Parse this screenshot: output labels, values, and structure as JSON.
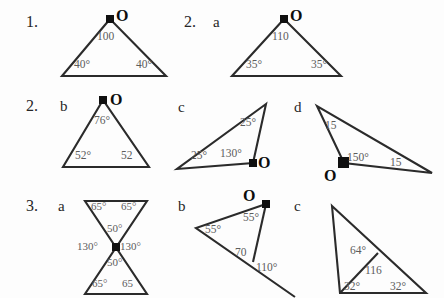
{
  "worksheet": {
    "background_color": "#fdfdfd",
    "line_color": "#2b2b2b",
    "label_color": "#5c5c5c",
    "rows": [
      {
        "number_label": "1.",
        "items": [
          {
            "part_label": "",
            "vertex_label": "O",
            "angles": [
              "100",
              "40°",
              "40°"
            ]
          },
          {
            "part_label": "a",
            "vertex_label": "O",
            "angles": [
              "110",
              "35°",
              "35°"
            ]
          }
        ]
      },
      {
        "number_label": "2.",
        "items": [
          {
            "part_label": "b",
            "vertex_label": "O",
            "angles": [
              "76°",
              "52°",
              "52"
            ]
          },
          {
            "part_label": "c",
            "vertex_label": "O",
            "angles": [
              "25°",
              "25°",
              "130°"
            ]
          },
          {
            "part_label": "d",
            "vertex_label": "O",
            "angles": [
              "15",
              "150°",
              "15"
            ]
          }
        ]
      },
      {
        "number_label": "3.",
        "items": [
          {
            "part_label": "a",
            "vertex_label": "",
            "angles": [
              "65°",
              "65°",
              "50°",
              "130°",
              "130°",
              "50°",
              "65°",
              "65"
            ]
          },
          {
            "part_label": "b",
            "vertex_label": "O",
            "angles": [
              "55°",
              "55°",
              "70",
              "110°"
            ]
          },
          {
            "part_label": "c",
            "vertex_label": "",
            "angles": [
              "64°",
              "116",
              "32°",
              "32°"
            ]
          }
        ]
      }
    ]
  },
  "row1": {
    "number": "1.",
    "fig1": {
      "o": "O",
      "apex_angle": "100",
      "left_angle": "40°",
      "right_angle": "40°"
    },
    "num2": "2.",
    "part_a": "a",
    "fig2a": {
      "o": "O",
      "apex_angle": "110",
      "left_angle": "35°",
      "right_angle": "35°"
    }
  },
  "row2": {
    "number": "2.",
    "part_b": "b",
    "fig2b": {
      "o": "O",
      "apex_angle": "76°",
      "left_angle": "52°",
      "right_angle": "52"
    },
    "part_c": "c",
    "fig2c": {
      "o": "O",
      "top_angle": "25°",
      "left_angle": "25°",
      "o_angle": "130°"
    },
    "part_d": "d",
    "fig2d": {
      "o": "O",
      "top_angle": "15",
      "o_angle": "150°",
      "right_angle": "15"
    }
  },
  "row3": {
    "number": "3.",
    "part_a": "a",
    "fig3a": {
      "top_left": "65°",
      "top_right": "65°",
      "upper_apex": "50°",
      "left_center": "130°",
      "right_center": "130°",
      "lower_apex": "50°",
      "bottom_left": "65°",
      "bottom_right": "65"
    },
    "part_b": "b",
    "fig3b": {
      "o": "O",
      "o_angle": "55°",
      "left_angle": "55°",
      "inner_angle": "70",
      "exterior_angle": "110°"
    },
    "part_c": "c",
    "fig3c": {
      "exterior_angle": "64°",
      "apex_angle": "116",
      "left_angle": "32°",
      "right_angle": "32°"
    }
  }
}
